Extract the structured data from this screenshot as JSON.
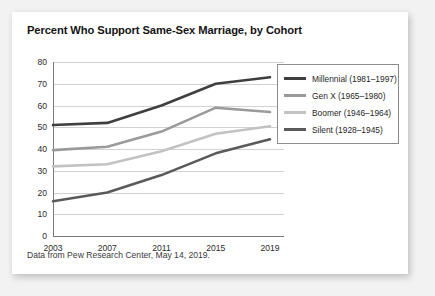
{
  "card": {
    "title": "Percent Who Support Same-Sex Marriage, by Cohort",
    "footnote": "Data from Pew Research Center, May 14, 2019."
  },
  "chart_data": {
    "type": "line",
    "title": "Percent Who Support Same-Sex Marriage, by Cohort",
    "xlabel": "",
    "ylabel": "",
    "categories": [
      "2003",
      "2007",
      "2011",
      "2015",
      "2019"
    ],
    "x": [
      2003,
      2007,
      2011,
      2015,
      2019
    ],
    "ylim": [
      0,
      80
    ],
    "yticks": [
      "0",
      "10",
      "20",
      "30",
      "40",
      "50",
      "60",
      "70",
      "80"
    ],
    "grid": true,
    "legend_position": "right",
    "series": [
      {
        "name": "Millennial (1981–1997)",
        "color": "#3f3f3f",
        "values": [
          51,
          52,
          60,
          70,
          73
        ]
      },
      {
        "name": "Gen X (1965–1980)",
        "color": "#9a9a9a",
        "values": [
          39.5,
          41,
          48,
          59,
          57
        ]
      },
      {
        "name": "Boomer (1946–1964)",
        "color": "#c2c2c2",
        "values": [
          32,
          33,
          39,
          47,
          50.5
        ]
      },
      {
        "name": "Silent (1928–1945)",
        "color": "#5a5a5a",
        "values": [
          16,
          20,
          28,
          38,
          44.5
        ]
      }
    ]
  }
}
